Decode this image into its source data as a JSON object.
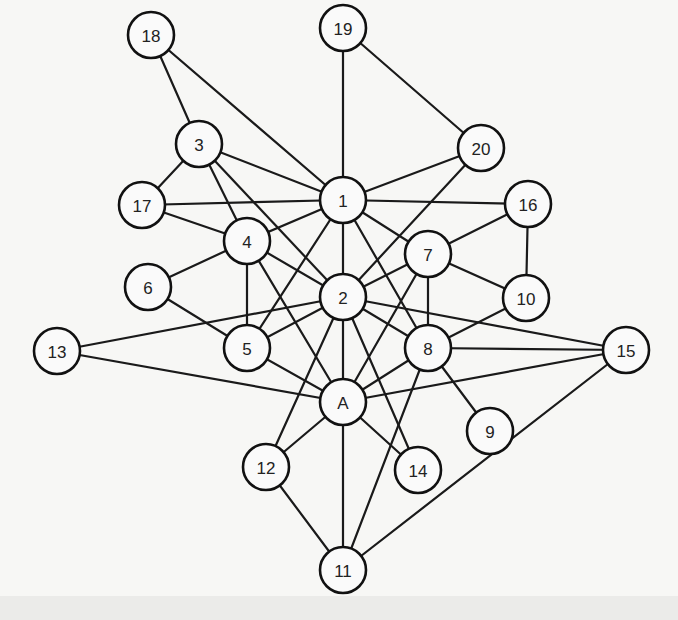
{
  "diagram": {
    "type": "undirected-graph",
    "node_radius": 23,
    "colors": {
      "background": "#f7f7f5",
      "stroke": "#111111",
      "node_fill": "#fafafa",
      "label": "#222222"
    },
    "nodes": [
      {
        "id": "18",
        "label": "18",
        "x": 151,
        "y": 35
      },
      {
        "id": "19",
        "label": "19",
        "x": 343,
        "y": 28
      },
      {
        "id": "3",
        "label": "3",
        "x": 199,
        "y": 144
      },
      {
        "id": "20",
        "label": "20",
        "x": 481,
        "y": 148
      },
      {
        "id": "1",
        "label": "1",
        "x": 343,
        "y": 200
      },
      {
        "id": "17",
        "label": "17",
        "x": 142,
        "y": 205
      },
      {
        "id": "16",
        "label": "16",
        "x": 528,
        "y": 204
      },
      {
        "id": "4",
        "label": "4",
        "x": 247,
        "y": 241
      },
      {
        "id": "7",
        "label": "7",
        "x": 428,
        "y": 254
      },
      {
        "id": "6",
        "label": "6",
        "x": 148,
        "y": 287
      },
      {
        "id": "2",
        "label": "2",
        "x": 343,
        "y": 297
      },
      {
        "id": "10",
        "label": "10",
        "x": 526,
        "y": 298
      },
      {
        "id": "13",
        "label": "13",
        "x": 57,
        "y": 351
      },
      {
        "id": "5",
        "label": "5",
        "x": 247,
        "y": 348
      },
      {
        "id": "8",
        "label": "8",
        "x": 428,
        "y": 348
      },
      {
        "id": "15",
        "label": "15",
        "x": 626,
        "y": 350
      },
      {
        "id": "A",
        "label": "A",
        "x": 343,
        "y": 402
      },
      {
        "id": "9",
        "label": "9",
        "x": 490,
        "y": 431
      },
      {
        "id": "12",
        "label": "12",
        "x": 266,
        "y": 467
      },
      {
        "id": "14",
        "label": "14",
        "x": 418,
        "y": 470
      },
      {
        "id": "11",
        "label": "11",
        "x": 343,
        "y": 570
      }
    ],
    "edges": [
      [
        "18",
        "3"
      ],
      [
        "18",
        "1"
      ],
      [
        "19",
        "1"
      ],
      [
        "19",
        "20"
      ],
      [
        "3",
        "17"
      ],
      [
        "3",
        "1"
      ],
      [
        "3",
        "4"
      ],
      [
        "3",
        "2"
      ],
      [
        "20",
        "1"
      ],
      [
        "20",
        "2"
      ],
      [
        "17",
        "1"
      ],
      [
        "17",
        "4"
      ],
      [
        "1",
        "16"
      ],
      [
        "1",
        "4"
      ],
      [
        "1",
        "2"
      ],
      [
        "1",
        "5"
      ],
      [
        "1",
        "7"
      ],
      [
        "1",
        "8"
      ],
      [
        "16",
        "7"
      ],
      [
        "16",
        "10"
      ],
      [
        "4",
        "6"
      ],
      [
        "4",
        "5"
      ],
      [
        "4",
        "2"
      ],
      [
        "4",
        "A"
      ],
      [
        "7",
        "2"
      ],
      [
        "7",
        "10"
      ],
      [
        "7",
        "8"
      ],
      [
        "7",
        "A"
      ],
      [
        "6",
        "5"
      ],
      [
        "2",
        "13"
      ],
      [
        "2",
        "5"
      ],
      [
        "2",
        "8"
      ],
      [
        "2",
        "15"
      ],
      [
        "2",
        "A"
      ],
      [
        "2",
        "12"
      ],
      [
        "2",
        "14"
      ],
      [
        "10",
        "8"
      ],
      [
        "13",
        "A"
      ],
      [
        "5",
        "A"
      ],
      [
        "8",
        "15"
      ],
      [
        "8",
        "A"
      ],
      [
        "8",
        "9"
      ],
      [
        "8",
        "11"
      ],
      [
        "15",
        "A"
      ],
      [
        "15",
        "11"
      ],
      [
        "A",
        "12"
      ],
      [
        "A",
        "14"
      ],
      [
        "A",
        "11"
      ],
      [
        "12",
        "11"
      ]
    ]
  }
}
